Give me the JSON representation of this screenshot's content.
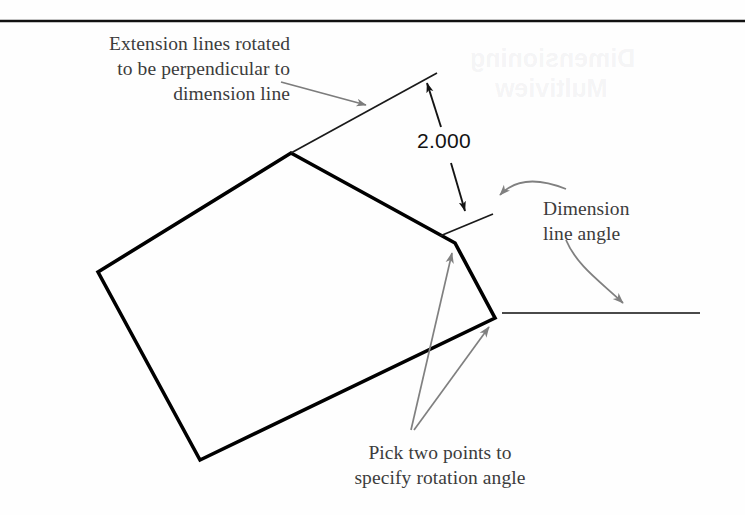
{
  "figure": {
    "background_color": "#fefefe",
    "rule_color": "#111111",
    "object_line_color": "#000000",
    "leader_color": "#7a7a7a",
    "dimension_line_color": "#1a1a1a",
    "label_text_color": "#3c3c3c",
    "dimension_text_color": "#121212"
  },
  "labels": {
    "extension_note": "Extension lines rotated\nto be perpendicular to\ndimension line",
    "dimension_angle_note": "Dimension\nline angle",
    "pick_points_note": "Pick two points to\nspecify rotation angle",
    "dimension_value": "2.000"
  },
  "ghost_text": {
    "line1": "Dimensioning",
    "line2": "Multiview"
  },
  "geometry": {
    "rule": {
      "x1": 0,
      "y1": 21,
      "x2": 745,
      "y2": 21
    },
    "polygon_points": "98,272 291,153 455,243 495,318 200,460",
    "horizontal_line": {
      "x1": 502,
      "y1": 313,
      "x2": 700,
      "y2": 313
    },
    "extension_line_upper": {
      "x1": 291,
      "y1": 153,
      "x2": 437,
      "y2": 73
    },
    "extension_line_lower": {
      "x1": 440,
      "y1": 236,
      "x2": 493,
      "y2": 214
    },
    "dimension_line": {
      "x1": 426,
      "y1": 81,
      "x2": 466,
      "y2": 213
    },
    "leader_extension": {
      "x1": 281,
      "y1": 82,
      "x2": 368,
      "y2": 106
    },
    "leader_dimangle_curve": "M 560,188 C 530,178 510,182 498,196",
    "leader_dimangle_down": "M 565,238 C 575,265 600,280 624,305",
    "leader_pick_a": {
      "x1": 411,
      "y1": 430,
      "x2": 452,
      "y2": 250
    },
    "leader_pick_b": {
      "x1": 413,
      "y1": 430,
      "x2": 490,
      "y2": 325
    }
  }
}
